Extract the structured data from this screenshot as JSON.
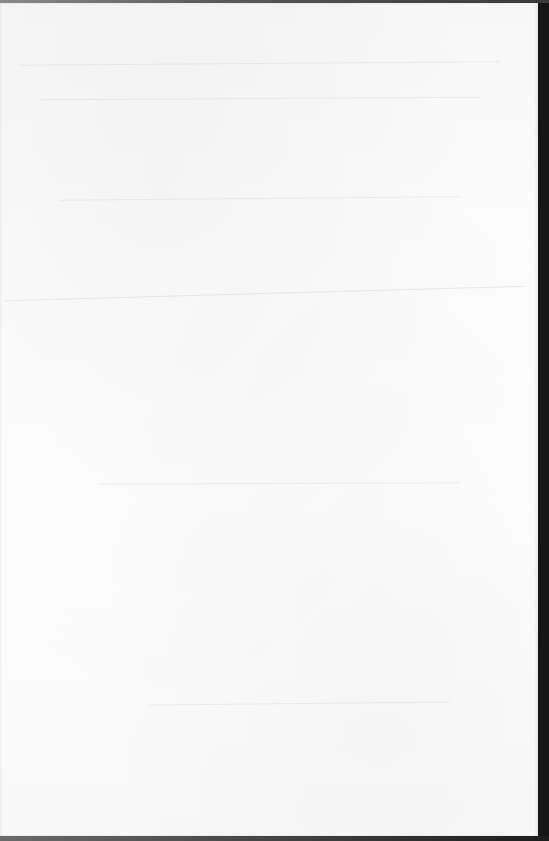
{
  "document": {
    "type": "scanned-page",
    "page_text": "",
    "page_color": "#fbfbfb",
    "background_color": "#151515"
  }
}
